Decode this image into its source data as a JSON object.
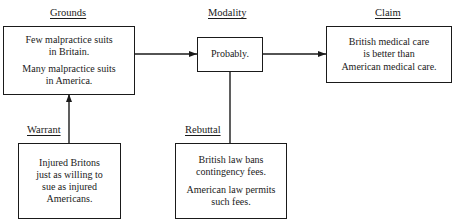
{
  "diagram": {
    "type": "Toulmin argument model",
    "labels": {
      "grounds": "Grounds",
      "modality": "Modality",
      "claim": "Claim",
      "warrant": "Warrant",
      "rebuttal": "Rebuttal"
    },
    "boxes": {
      "grounds": {
        "paragraphs": [
          [
            "Few malpractice suits",
            "in Britain."
          ],
          [
            "Many malpractice suits",
            "in America."
          ]
        ]
      },
      "modality": {
        "paragraphs": [
          [
            "Probably."
          ]
        ]
      },
      "claim": {
        "paragraphs": [
          [
            "British medical care",
            "is better than",
            "American medical care."
          ]
        ]
      },
      "warrant": {
        "paragraphs": [
          [
            "Injured Britons",
            "just as willing to",
            "sue as injured",
            "Americans."
          ]
        ]
      },
      "rebuttal": {
        "paragraphs": [
          [
            "British law bans",
            "contingency fees."
          ],
          [
            "American law permits",
            "such fees."
          ]
        ]
      }
    },
    "connections": [
      {
        "from": "grounds",
        "to": "modality",
        "arrow": "arrowhead-right"
      },
      {
        "from": "modality",
        "to": "claim",
        "arrow": "arrowhead-right"
      },
      {
        "from": "warrant",
        "to": "grounds",
        "arrow": "arrowhead-up"
      },
      {
        "from": "rebuttal",
        "to": "modality",
        "arrow": "none"
      }
    ]
  }
}
